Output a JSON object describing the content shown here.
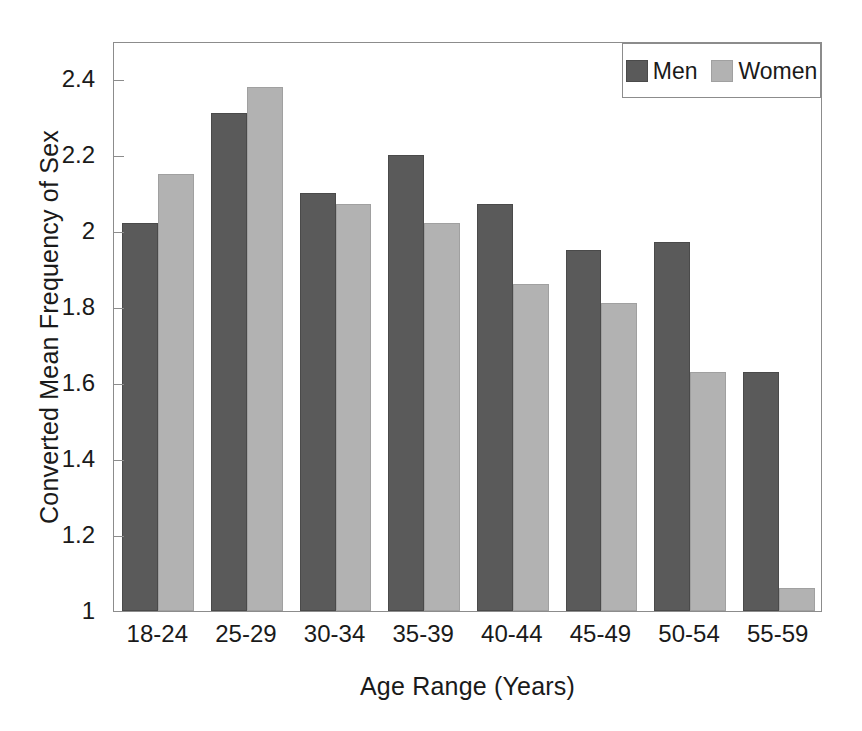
{
  "chart_data": {
    "type": "bar",
    "title": "",
    "xlabel": "Age Range (Years)",
    "ylabel": "Converted Mean Frequency of Sex",
    "categories": [
      "18-24",
      "25-29",
      "30-34",
      "35-39",
      "40-44",
      "45-49",
      "50-54",
      "55-59"
    ],
    "series": [
      {
        "name": "Men",
        "color": "#5a5a5a",
        "values": [
          2.02,
          2.31,
          2.1,
          2.2,
          2.07,
          1.95,
          1.97,
          1.63
        ]
      },
      {
        "name": "Women",
        "color": "#b2b2b2",
        "values": [
          2.15,
          2.38,
          2.07,
          2.02,
          1.86,
          1.81,
          1.63,
          1.06
        ]
      }
    ],
    "ylim": [
      1,
      2.5
    ],
    "yticks": [
      1,
      1.2,
      1.4,
      1.6,
      1.8,
      2,
      2.2,
      2.4
    ],
    "ytick_labels": [
      "1",
      "1.2",
      "1.4",
      "1.6",
      "1.8",
      "2",
      "2.2",
      "2.4"
    ],
    "grid": false,
    "legend_position": "top-right",
    "legend_entries": [
      "Men",
      "Women"
    ]
  },
  "axes": {
    "y_title": "Converted Mean Frequency of Sex",
    "x_title": "Age Range (Years)"
  },
  "legend": {
    "men_label": "Men",
    "women_label": "Women"
  }
}
